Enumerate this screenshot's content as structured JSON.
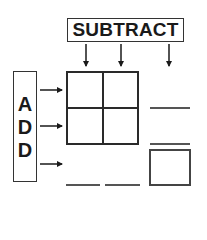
{
  "diagram": {
    "subtract_label": "SUBTRACT",
    "add_letters": [
      "A",
      "D",
      "D"
    ],
    "down_arrow_count": 3,
    "right_arrow_count": 3,
    "grid": {
      "rows": 2,
      "cols": 2
    },
    "blanks": {
      "right_column": 2,
      "bottom_row": 2,
      "answer_box": 1
    },
    "colors": {
      "stroke": "#2a2a2a",
      "background": "#ffffff"
    }
  }
}
